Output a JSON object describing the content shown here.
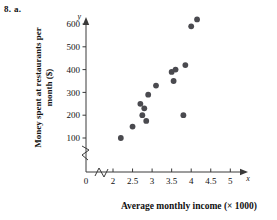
{
  "problem": {
    "label": "8. a."
  },
  "chart_data": {
    "type": "scatter",
    "title": "",
    "xlabel": "Average monthly income (× 1000)",
    "ylabel_line1": "Money spent at restaurants per",
    "ylabel_line2": "month ($)",
    "ylabel": "Money spent at restaurants per month ($)",
    "x_axis_letter": "x",
    "y_axis_letter": "y",
    "xlim": [
      2.0,
      5.0
    ],
    "ylim": [
      0,
      650
    ],
    "xticks": [
      2,
      2.5,
      3,
      3.5,
      4,
      4.5,
      5
    ],
    "xtick_labels": [
      "2",
      "2.5",
      "3",
      "3.5",
      "4",
      "4.5",
      "5"
    ],
    "yticks": [
      100,
      200,
      300,
      400,
      500,
      600
    ],
    "ytick_labels": [
      "100",
      "200",
      "300",
      "400",
      "500",
      "600"
    ],
    "origin_label": "0",
    "grid": false,
    "legend": false,
    "axis_break_x": true,
    "axis_break_y": true,
    "marker_color": "#4a4a4f",
    "axis_color": "#3a3a3a",
    "points": [
      {
        "x": 2.2,
        "y": 100
      },
      {
        "x": 2.5,
        "y": 150
      },
      {
        "x": 2.7,
        "y": 250
      },
      {
        "x": 2.75,
        "y": 200
      },
      {
        "x": 2.8,
        "y": 230
      },
      {
        "x": 2.85,
        "y": 175
      },
      {
        "x": 2.9,
        "y": 290
      },
      {
        "x": 3.1,
        "y": 330
      },
      {
        "x": 3.5,
        "y": 390
      },
      {
        "x": 3.55,
        "y": 350
      },
      {
        "x": 3.6,
        "y": 400
      },
      {
        "x": 3.8,
        "y": 200
      },
      {
        "x": 3.85,
        "y": 420
      },
      {
        "x": 4.0,
        "y": 590
      },
      {
        "x": 4.15,
        "y": 620
      }
    ]
  }
}
